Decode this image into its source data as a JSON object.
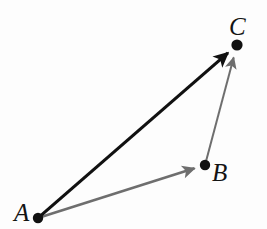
{
  "figure": {
    "caption": "Sum of Vectors",
    "background_color": "#fdfdfd",
    "width": 267,
    "height": 229
  },
  "points": [
    {
      "id": "A",
      "label": "A",
      "x": 38,
      "y": 218
    },
    {
      "id": "B",
      "label": "B",
      "x": 205,
      "y": 165
    },
    {
      "id": "C",
      "label": "C",
      "x": 237,
      "y": 45
    }
  ],
  "vectors": [
    {
      "id": "AC",
      "label": "A to C",
      "from": "A",
      "to": "C",
      "color": "#111111",
      "width": 3.2,
      "role": "resultant"
    },
    {
      "id": "AB",
      "label": "A to B",
      "from": "A",
      "to": "B",
      "color": "#6e6e6e",
      "width": 2.6,
      "role": "component"
    },
    {
      "id": "BC",
      "label": "B to C",
      "from": "B",
      "to": "C",
      "color": "#6e6e6e",
      "width": 2.0,
      "role": "component"
    }
  ],
  "style": {
    "dot_color": "#111111",
    "dot_radius": 5,
    "label_color": "#141414",
    "label_font_size": 25
  }
}
